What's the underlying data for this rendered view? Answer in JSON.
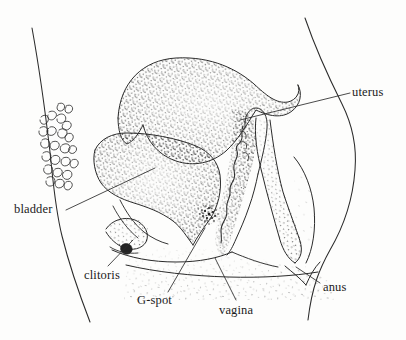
{
  "figure": {
    "type": "anatomical-line-drawing",
    "style": "pen-and-ink stipple illustration",
    "background_color": "#fdfdfc",
    "ink_color": "#1b1b1b",
    "width": 406,
    "height": 340
  },
  "labels": [
    {
      "id": "uterus",
      "text": "uterus",
      "x": 352,
      "y": 86,
      "leader_from": [
        350,
        93
      ],
      "leader_to": [
        240,
        120
      ]
    },
    {
      "id": "bladder",
      "text": "bladder",
      "x": 14,
      "y": 203,
      "leader_from": [
        66,
        210
      ],
      "leader_to": [
        155,
        168
      ]
    },
    {
      "id": "clitoris",
      "text": "clitoris",
      "x": 84,
      "y": 269,
      "leader_from": [
        108,
        266
      ],
      "leader_to": [
        133,
        240
      ]
    },
    {
      "id": "gspot",
      "text": "G-spot",
      "x": 137,
      "y": 294,
      "leader_from": [
        168,
        292
      ],
      "leader_to": [
        205,
        228
      ]
    },
    {
      "id": "vagina",
      "text": "vagina",
      "x": 219,
      "y": 304,
      "leader_from": [
        236,
        300
      ],
      "leader_to": [
        215,
        258
      ]
    },
    {
      "id": "anus",
      "text": "anus",
      "x": 323,
      "y": 281,
      "leader_from": [
        320,
        283
      ],
      "leader_to": [
        295,
        268
      ]
    }
  ],
  "structures": [
    {
      "id": "uterus-body",
      "name": "uterus"
    },
    {
      "id": "bladder-body",
      "name": "bladder"
    },
    {
      "id": "vaginal-canal",
      "name": "vagina"
    },
    {
      "id": "gspot-marker",
      "name": "G-spot"
    },
    {
      "id": "clitoris-body",
      "name": "clitoris"
    },
    {
      "id": "anus-opening",
      "name": "anus"
    },
    {
      "id": "rectum-body",
      "name": "rectum"
    },
    {
      "id": "pubic-hair",
      "name": "pubic hair"
    },
    {
      "id": "torso-front",
      "name": "abdominal contour"
    },
    {
      "id": "torso-back",
      "name": "buttock contour"
    }
  ]
}
